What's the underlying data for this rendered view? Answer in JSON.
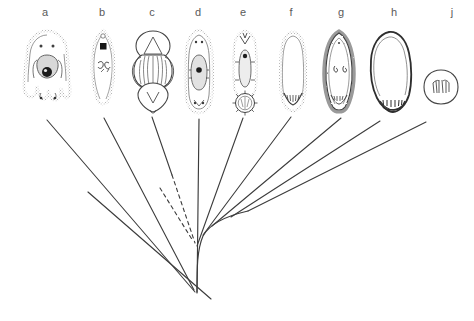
{
  "figure": {
    "type": "phylogenetic-cladogram",
    "background_color": "#ffffff",
    "ink_color": "#3c3c3c",
    "label_color": "#5a5a5a",
    "width": 474,
    "height": 321
  },
  "taxa": [
    {
      "label": "a",
      "label_x": 45,
      "label_y": 11,
      "specimen": {
        "shape": "lobed-bell",
        "center_x": 47,
        "top": 30,
        "bottom": 110,
        "width": 46,
        "stipple": true,
        "features": [
          "two-eye-spots",
          "central-oval-organ",
          "dark-nucleus-dot",
          "four-basal-lobes",
          "two-foot-processes"
        ]
      },
      "branch": {
        "x1": 47,
        "y1": 120,
        "x2": 196,
        "y2": 292,
        "style": "solid"
      }
    },
    {
      "label": "b",
      "label_x": 102,
      "label_y": 11,
      "specimen": {
        "shape": "elongate-spindle",
        "center_x": 103,
        "top": 30,
        "bottom": 107,
        "width": 24,
        "stipple": true,
        "features": [
          "black-square-marker",
          "paired-internal-hooks",
          "pointed-apex",
          "rounded-base"
        ]
      },
      "branch": {
        "x1": 103,
        "y1": 118,
        "x2": 196,
        "y2": 292,
        "style": "solid"
      }
    },
    {
      "label": "c",
      "label_x": 152,
      "label_y": 11,
      "specimen": {
        "shape": "three-chambered-capsule",
        "center_x": 153,
        "top": 30,
        "bottom": 110,
        "width": 40,
        "stipple": false,
        "features": [
          "apical-dome-with-triangle",
          "striated-mid-section",
          "pointed-basal-chamber",
          "lateral-flanges"
        ]
      },
      "branch": {
        "x1": 153,
        "y1": 118,
        "x2": 196,
        "y2": 243,
        "style": "solid"
      }
    },
    {
      "label": "d",
      "label_x": 198,
      "label_y": 11,
      "specimen": {
        "shape": "elongate-capsule",
        "center_x": 199,
        "top": 30,
        "bottom": 113,
        "width": 28,
        "stipple": true,
        "features": [
          "double-wall-outline",
          "central-oval-organ",
          "dark-nucleus-dot",
          "apical-spot-pair",
          "basal-spot-pair"
        ]
      },
      "branch": {
        "x1": 199,
        "y1": 120,
        "x2": 197,
        "y2": 290,
        "style": "solid"
      }
    },
    {
      "label": "e",
      "label_x": 243,
      "label_y": 11,
      "specimen": {
        "shape": "elongate-with-basal-rosette",
        "center_x": 245,
        "top": 30,
        "bottom": 112,
        "width": 30,
        "stipple": true,
        "features": [
          "apical-crown",
          "internal-elongate-organ",
          "dark-nucleus-dot",
          "radiating-spiny-basal-disc"
        ]
      },
      "branch": {
        "x1": 243,
        "y1": 118,
        "x2": 198,
        "y2": 240,
        "style": "solid"
      }
    },
    {
      "label": "f",
      "label_x": 291,
      "label_y": 11,
      "specimen": {
        "shape": "elongate-oval",
        "center_x": 293,
        "top": 32,
        "bottom": 110,
        "width": 26,
        "stipple": true,
        "features": [
          "thick-stippled-wall",
          "hollow-interior",
          "basal-chevron-structure"
        ]
      },
      "branch": {
        "x1": 291,
        "y1": 118,
        "x2": 203,
        "y2": 232,
        "style": "solid"
      }
    },
    {
      "label": "g",
      "label_x": 341,
      "label_y": 11,
      "specimen": {
        "shape": "teardrop",
        "center_x": 339,
        "top": 32,
        "bottom": 112,
        "width": 30,
        "stipple": true,
        "features": [
          "hairy-fringed-margin",
          "two-internal-comma-marks",
          "basal-cluster"
        ]
      },
      "branch": {
        "x1": 341,
        "y1": 118,
        "x2": 211,
        "y2": 226,
        "style": "solid"
      }
    },
    {
      "label": "h",
      "label_x": 394,
      "label_y": 11,
      "specimen": {
        "shape": "broad-rounded-sac",
        "center_x": 391,
        "top": 32,
        "bottom": 114,
        "width": 42,
        "stipple": false,
        "features": [
          "thick-dark-outline",
          "hollow-interior",
          "row-of-basal-denticles"
        ]
      },
      "branch": {
        "x1": 380,
        "y1": 122,
        "x2": 215,
        "y2": 222,
        "style": "solid"
      }
    },
    {
      "label": "j",
      "label_x": 452,
      "label_y": 11,
      "specimen": {
        "shape": "small-circle",
        "center_x": 441,
        "top": 68,
        "bottom": 106,
        "width": 34,
        "stipple": false,
        "features": [
          "thin-circular-outline",
          "internal-hatch-marks"
        ]
      },
      "branch": {
        "x1": 425,
        "y1": 123,
        "x2": 218,
        "y2": 218,
        "style": "solid"
      }
    }
  ],
  "tree": {
    "root_x": 197,
    "root_y": 292,
    "stem": {
      "x1": 197,
      "y1": 292,
      "x2": 199,
      "y2": 120
    },
    "basal_line": {
      "x1": 88,
      "y1": 192,
      "x2": 210,
      "y2": 299,
      "note": "long straight lineage crossing the stem near the base"
    },
    "dashed_branches": [
      {
        "x1": 149,
        "y1": 188,
        "x2": 193,
        "y2": 243,
        "style": "dashed"
      },
      {
        "x1": 161,
        "y1": 190,
        "x2": 195,
        "y2": 238,
        "style": "dashed"
      }
    ],
    "right_backbone": {
      "note": "curved backbone sweeping right from the base, shedding branches to f, g, h, j",
      "points": "197,292 198,247 204,233 214,224 232,216 260,209"
    },
    "nodes": [
      {
        "x": 197,
        "y": 292,
        "name": "root-node"
      },
      {
        "x": 196,
        "y": 243,
        "name": "node-1"
      },
      {
        "x": 204,
        "y": 233,
        "name": "node-2"
      },
      {
        "x": 214,
        "y": 224,
        "name": "node-3"
      },
      {
        "x": 232,
        "y": 216,
        "name": "node-4"
      }
    ]
  }
}
